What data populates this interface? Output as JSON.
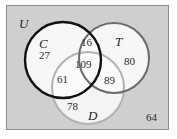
{
  "diagram": {
    "type": "venn-3-set",
    "universe": {
      "label": "U",
      "outside_count": "64"
    },
    "sets": [
      {
        "id": "C",
        "label": "C",
        "stroke": "#111111"
      },
      {
        "id": "T",
        "label": "T",
        "stroke": "#6b6b6b"
      },
      {
        "id": "D",
        "label": "D",
        "stroke": "#b2b2b2"
      }
    ],
    "regions": [
      {
        "id": "c-only",
        "label": "C only",
        "value": "27"
      },
      {
        "id": "ct",
        "label": "C and T only",
        "value": "16"
      },
      {
        "id": "t-only",
        "label": "T only",
        "value": "80"
      },
      {
        "id": "cd",
        "label": "C and D only",
        "value": "61"
      },
      {
        "id": "ctd",
        "label": "C and T and D",
        "value": "109"
      },
      {
        "id": "td",
        "label": "T and D only",
        "value": "89"
      },
      {
        "id": "d-only",
        "label": "D only",
        "value": "78"
      }
    ],
    "colors": {
      "universe_fill": "#cfcfcf",
      "universe_border": "#8e8e8e",
      "circle_fill": "#fbfbfb",
      "page_background": "#ffffff"
    }
  }
}
